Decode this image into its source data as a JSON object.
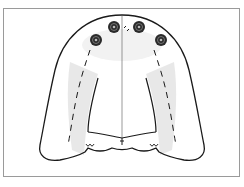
{
  "diagram": {
    "implant_count": 4,
    "colors": {
      "outline": "#1a1a1a",
      "shading": "#e4e4e4",
      "implant_fill": "#2a2a2a",
      "frame_border": "#9a9a9a",
      "background": "#ffffff"
    }
  }
}
